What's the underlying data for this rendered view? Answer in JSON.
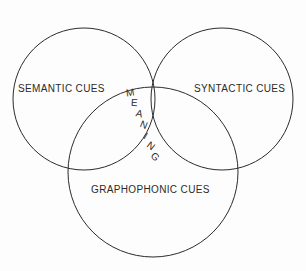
{
  "diagram": {
    "type": "venn",
    "title": "",
    "background_color": "#fdfdfd",
    "stroke_color": "#2b2b2b",
    "sets": [
      {
        "id": "semantic",
        "label": "SEMANTIC CUES",
        "position": "left",
        "center_x": 84,
        "center_y": 99,
        "radius": 71
      },
      {
        "id": "syntactic",
        "label": "SYNTACTIC CUES",
        "position": "right",
        "center_x": 222,
        "center_y": 99,
        "radius": 71
      },
      {
        "id": "graphophonic",
        "label": "GRAPHOPHONIC CUES",
        "position": "bottom",
        "center_x": 153,
        "center_y": 172,
        "radius": 85
      }
    ],
    "intersection": {
      "id": "meaning",
      "label": "MEANING",
      "orientation": "vertical-diagonal",
      "letters": [
        {
          "char": "M",
          "x": 0,
          "y": 0,
          "rotate": -8
        },
        {
          "char": "E",
          "x": 5,
          "y": 10,
          "rotate": 4
        },
        {
          "char": "A",
          "x": 10,
          "y": 21,
          "rotate": 14
        },
        {
          "char": "N",
          "x": 14,
          "y": 32,
          "rotate": 22
        },
        {
          "char": "I",
          "x": 18,
          "y": 43,
          "rotate": 30
        },
        {
          "char": "N",
          "x": 21,
          "y": 53,
          "rotate": 38
        },
        {
          "char": "G",
          "x": 25,
          "y": 64,
          "rotate": 46
        }
      ]
    }
  }
}
